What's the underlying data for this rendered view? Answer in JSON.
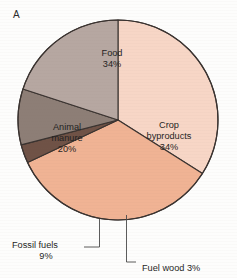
{
  "figure": {
    "panel_letter": "A",
    "background_color": "#fdfdfc"
  },
  "chart_data": {
    "type": "pie",
    "title": "",
    "subtitle": "",
    "xlabel": "",
    "ylabel": "",
    "legend_position": "none",
    "grid": false,
    "total": 100,
    "units": "%",
    "center": {
      "x": 118,
      "y": 120
    },
    "radius": 100,
    "start_angle_deg": 0,
    "direction": "clockwise",
    "categories": [
      "Food",
      "Crop byproducts",
      "Fuel wood",
      "Fossil fuels",
      "Animal manure"
    ],
    "values": [
      34,
      34,
      3,
      9,
      20
    ],
    "slices": [
      {
        "name": "Food",
        "label_line1": "Food",
        "label_line2": "34%",
        "value": 34,
        "color": "#f7d6c6",
        "stroke": "#3a3330",
        "start_deg": 0,
        "end_deg": 122.4,
        "label_x": 112,
        "label_y": 56
      },
      {
        "name": "Crop byproducts",
        "label_line1": "Crop",
        "label_line2": "byproducts",
        "label_line3": "34%",
        "value": 34,
        "color": "#f0b394",
        "stroke": "#3a3330",
        "start_deg": 122.4,
        "end_deg": 244.8,
        "label_x": 169,
        "label_y": 128
      },
      {
        "name": "Fuel wood",
        "label_line1": "Fuel wood 3%",
        "value": 3,
        "color": "#6f5246",
        "stroke": "#3a3330",
        "start_deg": 244.8,
        "end_deg": 255.6,
        "callout_label_x": 142,
        "callout_label_y": 271
      },
      {
        "name": "Fossil fuels",
        "label_line1": "Fossil fuels",
        "label_line2": "9%",
        "value": 9,
        "color": "#8d7e76",
        "stroke": "#3a3330",
        "start_deg": 255.6,
        "end_deg": 288.0,
        "callout_label_x": 12,
        "callout_label_y": 248
      },
      {
        "name": "Animal manure",
        "label_line1": "Animal",
        "label_line2": "manure",
        "label_line3": "20%",
        "value": 20,
        "color": "#b6a7a1",
        "stroke": "#3a3330",
        "start_deg": 288.0,
        "end_deg": 360,
        "label_x": 67,
        "label_y": 130
      }
    ],
    "annotations": [
      {
        "name": "fossil-fuels-callout",
        "text": "Fossil fuels 9%"
      },
      {
        "name": "fuel-wood-callout",
        "text": "Fuel wood 3%"
      }
    ]
  }
}
